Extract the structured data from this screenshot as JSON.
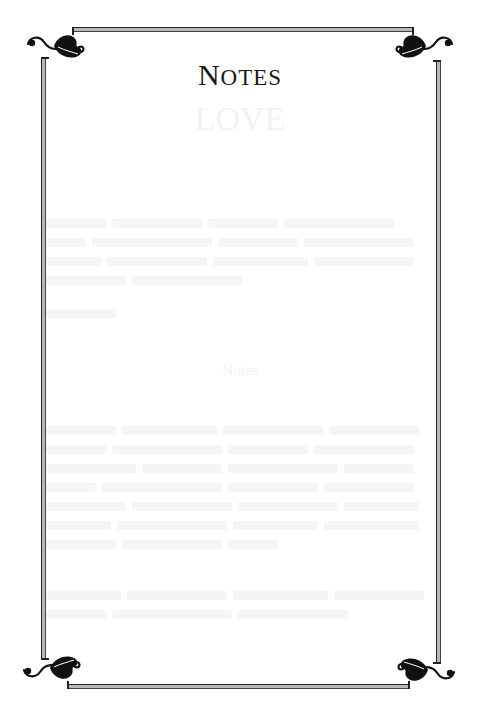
{
  "page": {
    "title_initial": "N",
    "title_rest": "OTES",
    "title_full": "Notes",
    "background_color": "#ffffff",
    "ink_color": "#1a1a1a"
  },
  "bleed_through": {
    "heading_top": "LOVE",
    "heading_mid": "Notes",
    "note": "Faint mirrored text from the reverse side of the page (illegible)"
  },
  "border": {
    "ornament_icon": "leaf-flourish-icon",
    "corners": [
      "top-left",
      "top-right",
      "bottom-left",
      "bottom-right"
    ]
  }
}
